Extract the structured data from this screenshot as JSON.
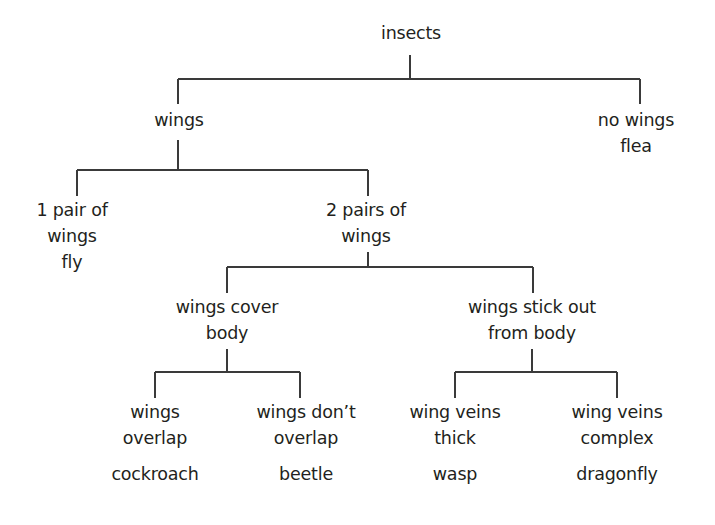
{
  "diagram": {
    "type": "dichotomous-key",
    "title": "insects",
    "colors": {
      "text": "#231f20",
      "lines": "#3a3a3a",
      "background": "#ffffff"
    },
    "nodes": {
      "root": {
        "lines": [
          "insects"
        ],
        "x": 411,
        "y": 20
      },
      "wings": {
        "lines": [
          "wings"
        ],
        "x": 179,
        "y": 107
      },
      "no_wings": {
        "lines": [
          "no wings",
          "flea"
        ],
        "x": 636,
        "y": 107
      },
      "one_pair": {
        "lines": [
          "1 pair of",
          "wings",
          "fly"
        ],
        "x": 72,
        "y": 197
      },
      "two_pairs": {
        "lines": [
          "2 pairs of",
          "wings"
        ],
        "x": 366,
        "y": 197
      },
      "wings_cover": {
        "lines": [
          "wings cover",
          "body"
        ],
        "x": 227,
        "y": 294
      },
      "wings_stick_out": {
        "lines": [
          "wings stick out",
          "from body"
        ],
        "x": 532,
        "y": 294
      },
      "wings_overlap": {
        "lines": [
          "wings",
          "overlap"
        ],
        "example": "cockroach",
        "x": 155,
        "y": 399
      },
      "wings_dont_overlap": {
        "lines": [
          "wings don’t",
          "overlap"
        ],
        "example": "beetle",
        "x": 306,
        "y": 399
      },
      "wing_veins_thick": {
        "lines": [
          "wing veins",
          "thick"
        ],
        "example": "wasp",
        "x": 455,
        "y": 399
      },
      "wing_veins_complex": {
        "lines": [
          "wing veins",
          "complex"
        ],
        "example": "dragonfly",
        "x": 617,
        "y": 399
      }
    },
    "connectors": [
      {
        "x1": 410,
        "y1": 55,
        "x2": 410,
        "y2": 79
      },
      {
        "x1": 178,
        "y1": 79,
        "x2": 640,
        "y2": 79
      },
      {
        "x1": 178,
        "y1": 79,
        "x2": 178,
        "y2": 104
      },
      {
        "x1": 640,
        "y1": 79,
        "x2": 640,
        "y2": 104
      },
      {
        "x1": 178,
        "y1": 140,
        "x2": 178,
        "y2": 170
      },
      {
        "x1": 77,
        "y1": 170,
        "x2": 368,
        "y2": 170
      },
      {
        "x1": 77,
        "y1": 170,
        "x2": 77,
        "y2": 196
      },
      {
        "x1": 368,
        "y1": 170,
        "x2": 368,
        "y2": 196
      },
      {
        "x1": 368,
        "y1": 252,
        "x2": 368,
        "y2": 267
      },
      {
        "x1": 227,
        "y1": 267,
        "x2": 533,
        "y2": 267
      },
      {
        "x1": 227,
        "y1": 267,
        "x2": 227,
        "y2": 293
      },
      {
        "x1": 533,
        "y1": 267,
        "x2": 533,
        "y2": 293
      },
      {
        "x1": 227,
        "y1": 349,
        "x2": 227,
        "y2": 372
      },
      {
        "x1": 155,
        "y1": 372,
        "x2": 300,
        "y2": 372
      },
      {
        "x1": 155,
        "y1": 372,
        "x2": 155,
        "y2": 398
      },
      {
        "x1": 300,
        "y1": 372,
        "x2": 300,
        "y2": 398
      },
      {
        "x1": 532,
        "y1": 349,
        "x2": 532,
        "y2": 372
      },
      {
        "x1": 455,
        "y1": 372,
        "x2": 617,
        "y2": 372
      },
      {
        "x1": 455,
        "y1": 372,
        "x2": 455,
        "y2": 398
      },
      {
        "x1": 617,
        "y1": 372,
        "x2": 617,
        "y2": 398
      }
    ]
  }
}
